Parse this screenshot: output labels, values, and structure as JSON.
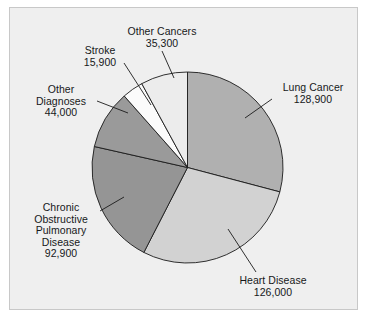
{
  "figure": {
    "background": "#ffffff",
    "panel_background": "#efefef",
    "panel_border": "#c8c8c8"
  },
  "chart_data": {
    "type": "pie",
    "title": "",
    "subtitle": "",
    "xlabel": "",
    "ylabel": "",
    "total": 443000,
    "start_angle_deg": 0,
    "direction": "clockwise",
    "legend": "none",
    "grid": false,
    "labels_outside": true,
    "categories": [
      "Lung Cancer",
      "Heart Disease",
      "Chronic Obstructive Pulmonary Disease",
      "Other Diagnoses",
      "Stroke",
      "Other Cancers"
    ],
    "values": [
      128900,
      126000,
      92900,
      44000,
      15900,
      35300
    ],
    "value_labels": [
      "128,900",
      "126,000",
      "92,900",
      "44,000",
      "15,900",
      "35,300"
    ],
    "percentages": [
      29.1,
      28.4,
      21.0,
      9.9,
      3.6,
      8.0
    ],
    "angles_deg": [
      104.8,
      102.4,
      75.5,
      35.8,
      12.9,
      28.7
    ],
    "colors": [
      "#b0b0b0",
      "#d2d2d2",
      "#959595",
      "#9a9a9a",
      "#fbfbfb",
      "#ececec"
    ],
    "slice_edge_color": "#1b1b1b",
    "slices": [
      {
        "name": "lung-cancer",
        "label_lines": [
          "Lung Cancer",
          "128,900"
        ],
        "value": 128900,
        "value_label": "128,900",
        "color": "#b0b0b0",
        "start_deg": 0,
        "end_deg": 104.8
      },
      {
        "name": "heart-disease",
        "label_lines": [
          "Heart Disease",
          "126,000"
        ],
        "value": 126000,
        "value_label": "126,000",
        "color": "#d2d2d2",
        "start_deg": 104.8,
        "end_deg": 207.2
      },
      {
        "name": "copd",
        "label_lines": [
          "Chronic",
          "Obstructive",
          "Pulmonary",
          "Disease",
          "92,900"
        ],
        "value": 92900,
        "value_label": "92,900",
        "color": "#959595",
        "start_deg": 207.2,
        "end_deg": 282.7
      },
      {
        "name": "other-diagnoses",
        "label_lines": [
          "Other",
          "Diagnoses",
          "44,000"
        ],
        "value": 44000,
        "value_label": "44,000",
        "color": "#9a9a9a",
        "start_deg": 282.7,
        "end_deg": 318.5
      },
      {
        "name": "stroke",
        "label_lines": [
          "Stroke",
          "15,900"
        ],
        "value": 15900,
        "value_label": "15,900",
        "color": "#fbfbfb",
        "start_deg": 318.5,
        "end_deg": 331.4
      },
      {
        "name": "other-cancers",
        "label_lines": [
          "Other Cancers",
          "35,300"
        ],
        "value": 35300,
        "value_label": "35,300",
        "color": "#ececec",
        "start_deg": 331.4,
        "end_deg": 360.0
      }
    ]
  },
  "labels": {
    "other_cancers": {
      "line1": "Other Cancers",
      "line2": "35,300"
    },
    "stroke": {
      "line1": "Stroke",
      "line2": "15,900"
    },
    "other_diagnoses": {
      "line1": "Other",
      "line2": "Diagnoses",
      "line3": "44,000"
    },
    "copd": {
      "line1": "Chronic",
      "line2": "Obstructive",
      "line3": "Pulmonary",
      "line4": "Disease",
      "line5": "92,900"
    },
    "heart_disease": {
      "line1": "Heart Disease",
      "line2": "126,000"
    },
    "lung_cancer": {
      "line1": "Lung Cancer",
      "line2": "128,900"
    }
  }
}
